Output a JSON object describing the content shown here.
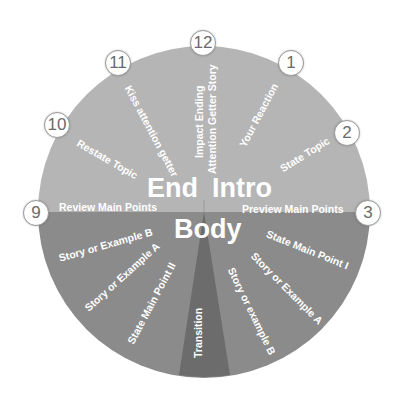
{
  "diagram": {
    "type": "speech-structure-clock-wheel",
    "colors": {
      "background": "#ffffff",
      "upper_half": "#b5b5b5",
      "lower_half": "#8b8b8b",
      "transition_wedge": "#6c6c6c",
      "text": "#ffffff",
      "badge_fill": "#ffffff",
      "badge_text": "#6a6a6a"
    },
    "sections": {
      "end": "End",
      "intro": "Intro",
      "body": "Body"
    },
    "badges": [
      "12",
      "1",
      "2",
      "3",
      "9",
      "10",
      "11"
    ],
    "labels": {
      "impact_ending": "Impact Ending",
      "attention_getter_story": "Attention Getter Story",
      "your_reaction": "Your Reaction",
      "state_topic": "State Topic",
      "preview_main_points": "Preview Main Points",
      "state_main_point_1": "State Main Point I",
      "story_example_a_right": "Story or Example A",
      "story_example_b_right": "Story or example B",
      "transition": "Transition",
      "state_main_point_2": "State Main Point II",
      "story_example_a_left": "Story or Example A",
      "story_example_b_left": "Story or Example B",
      "review_main_points": "Review Main Points",
      "restate_topic": "Restate Topic",
      "kiss_attention_getter": "Kiss attention getter"
    }
  }
}
